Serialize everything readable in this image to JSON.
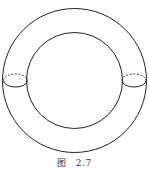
{
  "figure": {
    "type": "torus-diagram",
    "stroke_color": "#222222",
    "outer_circle": {
      "cx": 74.5,
      "cy": 80.5,
      "r": 72
    },
    "inner_circle": {
      "cx": 74.5,
      "cy": 80.5,
      "r": 48
    },
    "cross_sections": [
      {
        "side": "left",
        "cx": 15.5,
        "cy": 80.5,
        "rx": 12,
        "ry": 6.5,
        "top_dashed": true
      },
      {
        "side": "right",
        "cx": 134,
        "cy": 80.5,
        "rx": 12,
        "ry": 6.5,
        "top_dashed": true
      }
    ]
  },
  "caption": {
    "label": "图",
    "number": "2.7"
  }
}
